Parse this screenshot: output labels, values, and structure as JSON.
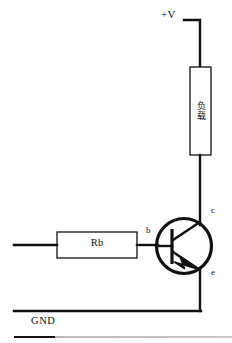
{
  "diagram": {
    "stroke_color": "#111111",
    "background_color": "#ffffff",
    "labels": {
      "supply": "+V",
      "ground": "GND",
      "load": "负载",
      "base_resistor": "Rb",
      "terminal_collector": "c",
      "terminal_emitter": "e",
      "terminal_base": "b"
    },
    "components": [
      {
        "name": "load-resistor",
        "label": "负载",
        "type": "resistor-box",
        "orientation": "vertical"
      },
      {
        "name": "base-resistor",
        "label": "Rb",
        "type": "resistor-box",
        "orientation": "horizontal"
      },
      {
        "name": "transistor",
        "label": "",
        "type": "npn-bjt",
        "orientation": "vertical"
      }
    ],
    "nets": [
      {
        "name": "supply-rail",
        "from": "+V",
        "to": "负载"
      },
      {
        "name": "collector-net",
        "from": "负载",
        "to": "c"
      },
      {
        "name": "base-net",
        "from": "Rb",
        "to": "b"
      },
      {
        "name": "emitter-net",
        "from": "e",
        "to": "GND"
      },
      {
        "name": "input-rail",
        "from": "input",
        "to": "Rb"
      }
    ]
  }
}
